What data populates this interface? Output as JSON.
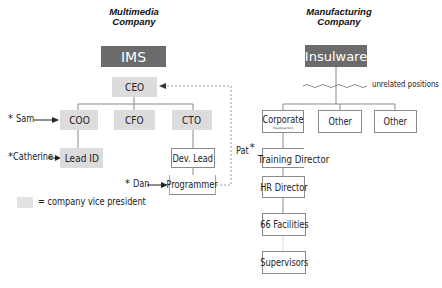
{
  "left_org": {
    "title_line1": "Multimedia",
    "title_line2": "Company",
    "brand": "IMS",
    "ceo": "CEO",
    "vps": [
      "COO",
      "CFO",
      "CTO"
    ],
    "lead_id": "Lead ID",
    "dev_lead": "Dev. Lead",
    "programmer": "Programmer",
    "people": {
      "sam": "Sam",
      "catherine": "Catherine",
      "dan": "Dan"
    },
    "legend": {
      "text": "= company vice president"
    }
  },
  "right_org": {
    "title_line1": "Manufacturing",
    "title_line2": "Company",
    "brand": "Insulware",
    "unrelated_label": "unrelated positions",
    "top_boxes": [
      "Corporate",
      "Other",
      "Other"
    ],
    "corporate_sub": "Headquarters",
    "chain": [
      "Training Director",
      "HR Director",
      "66 Facilities",
      "Supervisors"
    ],
    "people": {
      "pat": "Pat"
    }
  },
  "symbols": {
    "star": "*",
    "arrow": "→"
  },
  "colors": {
    "brand_box": "#6b6b6b",
    "vp_box": "#dcdcdc",
    "line": "#8a8a8a"
  }
}
